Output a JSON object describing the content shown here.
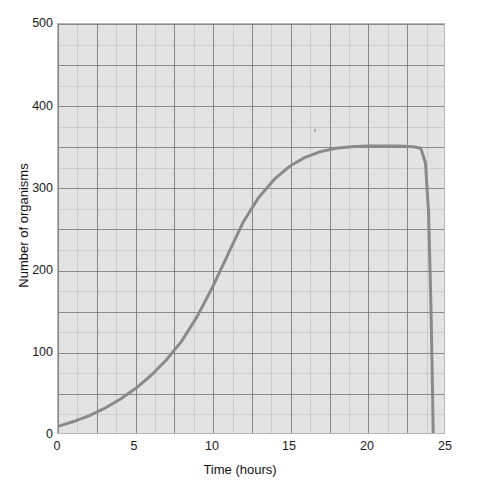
{
  "chart_data": {
    "type": "line",
    "title": "",
    "xlabel": "Time (hours)",
    "ylabel": "Number of organisms",
    "xlim": [
      0,
      25
    ],
    "ylim": [
      0,
      500
    ],
    "xticks": [
      0,
      5,
      10,
      15,
      20,
      25
    ],
    "yticks": [
      0,
      100,
      200,
      300,
      400,
      500
    ],
    "grid": true,
    "grid_major_x_step": 2.5,
    "grid_major_y_step": 50,
    "legend": "none",
    "series": [
      {
        "name": "Number of organisms",
        "color": "#8a8a8a",
        "line_width": 3,
        "x": [
          0,
          1,
          2,
          3,
          4,
          5,
          6,
          7,
          8,
          9,
          10,
          11,
          12,
          13,
          14,
          15,
          16,
          17,
          18,
          19,
          20,
          21,
          22,
          23,
          23.5,
          23.8,
          24.0,
          24.15,
          24.25,
          24.3
        ],
        "values": [
          8,
          14,
          21,
          30,
          41,
          54,
          70,
          89,
          112,
          142,
          178,
          218,
          258,
          288,
          310,
          326,
          337,
          344,
          348,
          350,
          351,
          351,
          351,
          350,
          348,
          330,
          270,
          160,
          60,
          0
        ]
      }
    ],
    "annotations": [
      {
        "name": "lag-phase",
        "x_range": [
          0,
          5
        ]
      },
      {
        "name": "exponential-phase",
        "x_range": [
          5,
          15
        ]
      },
      {
        "name": "stationary-phase",
        "x_range": [
          17,
          23.5
        ]
      },
      {
        "name": "death-phase",
        "x_range": [
          23.5,
          24.3
        ]
      }
    ]
  },
  "axes": {
    "y_tick_labels": [
      "500",
      "400",
      "300",
      "200",
      "100",
      "0"
    ],
    "x_tick_labels": [
      "0",
      "5",
      "10",
      "15",
      "20",
      "25"
    ],
    "x_title": "Time (hours)",
    "y_title": "Number of organisms"
  },
  "colors": {
    "plot_background": "#e3e3e3",
    "page_background": "#ffffff",
    "curve": "#8a8a8a",
    "grid_major": "#7a7a7a",
    "grid_minor": "#969696",
    "axis_text": "#1a1a1a",
    "frame": "#b6b6b6"
  }
}
